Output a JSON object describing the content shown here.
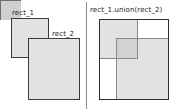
{
  "figure": {
    "width": 181,
    "height": 111,
    "background": "#ffffff",
    "divider_color": "#8d8d8d"
  },
  "colors": {
    "rect_fill": "#e2e2e2",
    "rect_stroke": "#3a3a3a",
    "overlap_fill": "#cfcfcf",
    "ghost_stroke": "#8a8a8a",
    "text": "#1a1a1a",
    "white": "#ffffff"
  },
  "left_panel": {
    "name": "separate-rectangles",
    "labels": {
      "rect_1": "rect_1",
      "rect_2": "rect_2"
    },
    "rect_1": {
      "x": 11,
      "y": 18,
      "width": 38,
      "height": 40
    },
    "rect_2": {
      "x": 28,
      "y": 38,
      "width": 52,
      "height": 62
    },
    "overlap": {
      "x": 28,
      "y": 38,
      "width": 21,
      "height": 20
    }
  },
  "right_panel": {
    "name": "union-rectangle",
    "labels": {
      "title": "rect_1.union(rect_2)"
    },
    "union_bounds": {
      "x": 99,
      "y": 19,
      "width": 70,
      "height": 81
    },
    "rect_1": {
      "x": 99,
      "y": 19,
      "width": 39,
      "height": 40
    },
    "rect_2": {
      "x": 116,
      "y": 38,
      "width": 53,
      "height": 62
    },
    "overlap": {
      "x": 116,
      "y": 38,
      "width": 22,
      "height": 21
    }
  }
}
